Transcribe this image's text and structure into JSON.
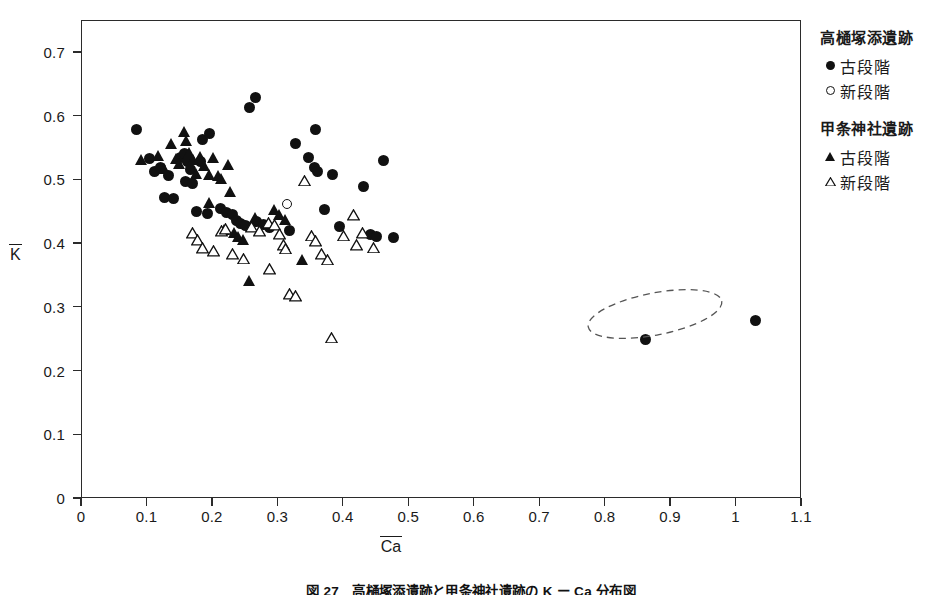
{
  "axes": {
    "x_label": "Ca",
    "y_label": "K",
    "x_ticks": [
      "0",
      "0.1",
      "0.2",
      "0.3",
      "0.4",
      "0.5",
      "0.6",
      "0.7",
      "0.8",
      "0.9",
      "1",
      "1.1"
    ],
    "y_ticks": [
      "0.7",
      "0.6",
      "0.5",
      "0.4",
      "0.3",
      "0.2",
      "0.1",
      "0"
    ]
  },
  "legend": {
    "groups": [
      {
        "title": "高樋塚添遺跡",
        "entries": [
          {
            "marker": "filled-circle",
            "label": "古段階"
          },
          {
            "marker": "open-circle",
            "label": "新段階"
          }
        ]
      },
      {
        "title": "甲条神社遺跡",
        "entries": [
          {
            "marker": "filled-triangle",
            "label": "古段階"
          },
          {
            "marker": "open-triangle",
            "label": "新段階"
          }
        ]
      }
    ]
  },
  "caption": "図 27　高樋塚添遺跡と甲条神社遺跡の K ー Ca 分布図",
  "annotations": [
    {
      "type": "dashed-ellipse",
      "cx": 0.945,
      "cy": 0.265,
      "rx": 0.095,
      "ry": 0.032,
      "rotation_deg": -11
    }
  ],
  "chart_data": {
    "type": "scatter",
    "title": "",
    "xlabel": "Ca",
    "ylabel": "K",
    "xlim": [
      0,
      1.1
    ],
    "ylim": [
      0,
      0.75
    ],
    "grid": false,
    "legend_position": "right",
    "series": [
      {
        "name": "高樋塚添遺跡 古段階",
        "marker": "filled-circle",
        "points": [
          [
            0.085,
            0.578
          ],
          [
            0.105,
            0.533
          ],
          [
            0.112,
            0.512
          ],
          [
            0.122,
            0.518
          ],
          [
            0.133,
            0.506
          ],
          [
            0.128,
            0.472
          ],
          [
            0.141,
            0.47
          ],
          [
            0.152,
            0.535
          ],
          [
            0.158,
            0.541
          ],
          [
            0.163,
            0.528
          ],
          [
            0.168,
            0.515
          ],
          [
            0.16,
            0.497
          ],
          [
            0.171,
            0.493
          ],
          [
            0.186,
            0.563
          ],
          [
            0.196,
            0.572
          ],
          [
            0.182,
            0.528
          ],
          [
            0.177,
            0.449
          ],
          [
            0.193,
            0.447
          ],
          [
            0.213,
            0.455
          ],
          [
            0.222,
            0.448
          ],
          [
            0.231,
            0.445
          ],
          [
            0.238,
            0.436
          ],
          [
            0.244,
            0.43
          ],
          [
            0.252,
            0.427
          ],
          [
            0.258,
            0.612
          ],
          [
            0.266,
            0.628
          ],
          [
            0.268,
            0.434
          ],
          [
            0.279,
            0.429
          ],
          [
            0.288,
            0.424
          ],
          [
            0.318,
            0.42
          ],
          [
            0.328,
            0.556
          ],
          [
            0.347,
            0.535
          ],
          [
            0.358,
            0.578
          ],
          [
            0.356,
            0.519
          ],
          [
            0.362,
            0.513
          ],
          [
            0.372,
            0.452
          ],
          [
            0.384,
            0.508
          ],
          [
            0.395,
            0.426
          ],
          [
            0.432,
            0.489
          ],
          [
            0.443,
            0.413
          ],
          [
            0.452,
            0.41
          ],
          [
            0.462,
            0.53
          ],
          [
            0.478,
            0.409
          ],
          [
            0.862,
            0.248
          ],
          [
            1.03,
            0.279
          ]
        ]
      },
      {
        "name": "高樋塚添遺跡 新段階",
        "marker": "open-circle",
        "points": [
          [
            0.315,
            0.46
          ]
        ]
      },
      {
        "name": "甲条神社遺跡 古段階",
        "marker": "filled-triangle",
        "points": [
          [
            0.092,
            0.53
          ],
          [
            0.118,
            0.536
          ],
          [
            0.128,
            0.516
          ],
          [
            0.139,
            0.554
          ],
          [
            0.146,
            0.531
          ],
          [
            0.151,
            0.524
          ],
          [
            0.158,
            0.573
          ],
          [
            0.161,
            0.56
          ],
          [
            0.166,
            0.54
          ],
          [
            0.172,
            0.53
          ],
          [
            0.176,
            0.508
          ],
          [
            0.183,
            0.534
          ],
          [
            0.189,
            0.52
          ],
          [
            0.196,
            0.506
          ],
          [
            0.203,
            0.533
          ],
          [
            0.21,
            0.505
          ],
          [
            0.215,
            0.5
          ],
          [
            0.219,
            0.42
          ],
          [
            0.226,
            0.521
          ],
          [
            0.234,
            0.415
          ],
          [
            0.241,
            0.409
          ],
          [
            0.249,
            0.404
          ],
          [
            0.257,
            0.34
          ],
          [
            0.266,
            0.439
          ],
          [
            0.296,
            0.451
          ],
          [
            0.303,
            0.444
          ],
          [
            0.313,
            0.436
          ],
          [
            0.338,
            0.373
          ],
          [
            0.197,
            0.462
          ],
          [
            0.229,
            0.479
          ]
        ]
      },
      {
        "name": "甲条神社遺跡 新段階",
        "marker": "open-triangle",
        "points": [
          [
            0.171,
            0.415
          ],
          [
            0.178,
            0.404
          ],
          [
            0.186,
            0.391
          ],
          [
            0.203,
            0.386
          ],
          [
            0.214,
            0.418
          ],
          [
            0.221,
            0.421
          ],
          [
            0.232,
            0.382
          ],
          [
            0.248,
            0.375
          ],
          [
            0.261,
            0.424
          ],
          [
            0.272,
            0.418
          ],
          [
            0.287,
            0.43
          ],
          [
            0.295,
            0.427
          ],
          [
            0.303,
            0.413
          ],
          [
            0.309,
            0.396
          ],
          [
            0.312,
            0.39
          ],
          [
            0.318,
            0.319
          ],
          [
            0.327,
            0.316
          ],
          [
            0.341,
            0.497
          ],
          [
            0.352,
            0.411
          ],
          [
            0.358,
            0.402
          ],
          [
            0.368,
            0.382
          ],
          [
            0.376,
            0.373
          ],
          [
            0.401,
            0.411
          ],
          [
            0.416,
            0.443
          ],
          [
            0.421,
            0.396
          ],
          [
            0.43,
            0.415
          ],
          [
            0.447,
            0.392
          ],
          [
            0.383,
            0.251
          ],
          [
            0.288,
            0.358
          ]
        ]
      }
    ]
  }
}
